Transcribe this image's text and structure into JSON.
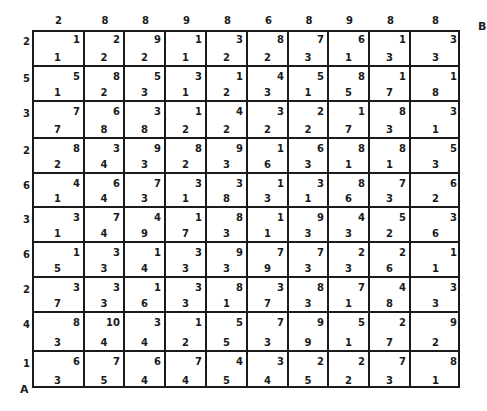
{
  "puzzle": {
    "corner_start": "A",
    "corner_end": "B",
    "column_headers": [
      "2",
      "8",
      "8",
      "9",
      "8",
      "6",
      "8",
      "9",
      "8",
      "8"
    ],
    "row_headers": [
      "2",
      "5",
      "3",
      "2",
      "6",
      "3",
      "6",
      "2",
      "4",
      "1"
    ],
    "cells": [
      [
        {
          "tr": "1",
          "bl": "1"
        },
        {
          "tr": "2",
          "bl": "2"
        },
        {
          "tr": "9",
          "bl": "2"
        },
        {
          "tr": "1",
          "bl": "1"
        },
        {
          "tr": "3",
          "bl": "2"
        },
        {
          "tr": "8",
          "bl": "2"
        },
        {
          "tr": "7",
          "bl": "3"
        },
        {
          "tr": "6",
          "bl": "1"
        },
        {
          "tr": "1",
          "bl": "3"
        },
        {
          "tr": "3",
          "bl": "3"
        }
      ],
      [
        {
          "tr": "5",
          "bl": "1"
        },
        {
          "tr": "8",
          "bl": "2"
        },
        {
          "tr": "5",
          "bl": "3"
        },
        {
          "tr": "3",
          "bl": "1"
        },
        {
          "tr": "1",
          "bl": "2"
        },
        {
          "tr": "4",
          "bl": "3"
        },
        {
          "tr": "5",
          "bl": "1"
        },
        {
          "tr": "8",
          "bl": "5"
        },
        {
          "tr": "1",
          "bl": "7"
        },
        {
          "tr": "1",
          "bl": "8"
        }
      ],
      [
        {
          "tr": "7",
          "bl": "7"
        },
        {
          "tr": "6",
          "bl": "8"
        },
        {
          "tr": "3",
          "bl": "8"
        },
        {
          "tr": "1",
          "bl": "2"
        },
        {
          "tr": "4",
          "bl": "2"
        },
        {
          "tr": "3",
          "bl": "2"
        },
        {
          "tr": "2",
          "bl": "2"
        },
        {
          "tr": "1",
          "bl": "7"
        },
        {
          "tr": "8",
          "bl": "3"
        },
        {
          "tr": "3",
          "bl": "1"
        }
      ],
      [
        {
          "tr": "8",
          "bl": "2"
        },
        {
          "tr": "3",
          "bl": "4"
        },
        {
          "tr": "9",
          "bl": "3"
        },
        {
          "tr": "8",
          "bl": "2"
        },
        {
          "tr": "9",
          "bl": "3"
        },
        {
          "tr": "1",
          "bl": "6"
        },
        {
          "tr": "6",
          "bl": "3"
        },
        {
          "tr": "8",
          "bl": "1"
        },
        {
          "tr": "8",
          "bl": "1"
        },
        {
          "tr": "5",
          "bl": "3"
        }
      ],
      [
        {
          "tr": "4",
          "bl": "1"
        },
        {
          "tr": "6",
          "bl": "4"
        },
        {
          "tr": "7",
          "bl": "3"
        },
        {
          "tr": "3",
          "bl": "1"
        },
        {
          "tr": "3",
          "bl": "8"
        },
        {
          "tr": "1",
          "bl": "3"
        },
        {
          "tr": "3",
          "bl": "1"
        },
        {
          "tr": "8",
          "bl": "6"
        },
        {
          "tr": "7",
          "bl": "3"
        },
        {
          "tr": "6",
          "bl": "2"
        }
      ],
      [
        {
          "tr": "3",
          "bl": "1"
        },
        {
          "tr": "7",
          "bl": "4"
        },
        {
          "tr": "4",
          "bl": "9"
        },
        {
          "tr": "1",
          "bl": "7"
        },
        {
          "tr": "8",
          "bl": "3"
        },
        {
          "tr": "1",
          "bl": "1"
        },
        {
          "tr": "9",
          "bl": "3"
        },
        {
          "tr": "4",
          "bl": "3"
        },
        {
          "tr": "5",
          "bl": "2"
        },
        {
          "tr": "3",
          "bl": "6"
        }
      ],
      [
        {
          "tr": "1",
          "bl": "5"
        },
        {
          "tr": "3",
          "bl": "3"
        },
        {
          "tr": "1",
          "bl": "4"
        },
        {
          "tr": "3",
          "bl": "3"
        },
        {
          "tr": "9",
          "bl": "3"
        },
        {
          "tr": "7",
          "bl": "9"
        },
        {
          "tr": "7",
          "bl": "3"
        },
        {
          "tr": "2",
          "bl": "3"
        },
        {
          "tr": "2",
          "bl": "6"
        },
        {
          "tr": "1",
          "bl": "1"
        }
      ],
      [
        {
          "tr": "3",
          "bl": "7"
        },
        {
          "tr": "3",
          "bl": "3"
        },
        {
          "tr": "1",
          "bl": "6"
        },
        {
          "tr": "3",
          "bl": "3"
        },
        {
          "tr": "8",
          "bl": "1"
        },
        {
          "tr": "3",
          "bl": "7"
        },
        {
          "tr": "8",
          "bl": "3"
        },
        {
          "tr": "7",
          "bl": "1"
        },
        {
          "tr": "4",
          "bl": "8"
        },
        {
          "tr": "3",
          "bl": "3"
        }
      ],
      [
        {
          "tr": "8",
          "bl": "3"
        },
        {
          "tr": "10",
          "bl": "4"
        },
        {
          "tr": "3",
          "bl": "4"
        },
        {
          "tr": "1",
          "bl": "2"
        },
        {
          "tr": "5",
          "bl": "5"
        },
        {
          "tr": "7",
          "bl": "3"
        },
        {
          "tr": "9",
          "bl": "9"
        },
        {
          "tr": "5",
          "bl": "1"
        },
        {
          "tr": "2",
          "bl": "7"
        },
        {
          "tr": "9",
          "bl": "2"
        }
      ],
      [
        {
          "tr": "6",
          "bl": "3"
        },
        {
          "tr": "7",
          "bl": "5"
        },
        {
          "tr": "6",
          "bl": "4"
        },
        {
          "tr": "7",
          "bl": "4"
        },
        {
          "tr": "4",
          "bl": "5"
        },
        {
          "tr": "3",
          "bl": "4"
        },
        {
          "tr": "2",
          "bl": "5"
        },
        {
          "tr": "2",
          "bl": "2"
        },
        {
          "tr": "7",
          "bl": "3"
        },
        {
          "tr": "8",
          "bl": "1"
        }
      ]
    ]
  }
}
